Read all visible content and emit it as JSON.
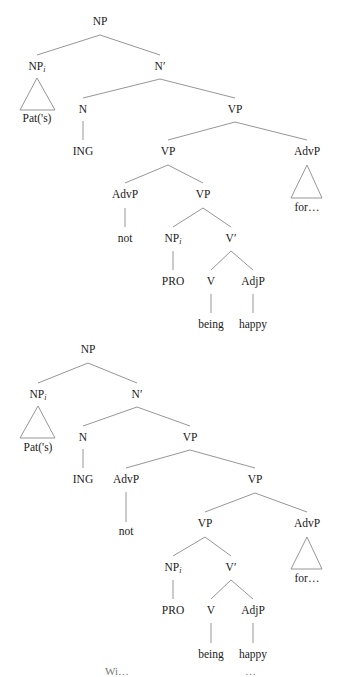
{
  "trees": [
    {
      "id": "tree-1",
      "nodes": {
        "root": "NP",
        "np_i": "NP",
        "np_i_sub": "i",
        "nbar": "N′",
        "pat": "Pat('s)",
        "n": "N",
        "vp1": "VP",
        "ing": "ING",
        "vp2": "VP",
        "advp_for": "AdvP",
        "for": "for…",
        "advp_not": "AdvP",
        "vp3": "VP",
        "not": "not",
        "np_pro": "NP",
        "np_pro_sub": "i",
        "vbar": "V′",
        "pro": "PRO",
        "v": "V",
        "adjp": "AdjP",
        "being": "being",
        "happy": "happy"
      }
    },
    {
      "id": "tree-2",
      "nodes": {
        "root": "NP",
        "np_i": "NP",
        "np_i_sub": "i",
        "nbar": "N′",
        "pat": "Pat('s)",
        "n": "N",
        "vp1": "VP",
        "ing": "ING",
        "advp_not": "AdvP",
        "vp2": "VP",
        "not": "not",
        "vp3": "VP",
        "advp_for": "AdvP",
        "for": "for…",
        "np_pro": "NP",
        "np_pro_sub": "i",
        "vbar": "V′",
        "pro": "PRO",
        "v": "V",
        "adjp": "AdjP",
        "being": "being",
        "happy": "happy"
      }
    }
  ],
  "footer_fragment": {
    "left": "Wi…",
    "right": "…"
  }
}
